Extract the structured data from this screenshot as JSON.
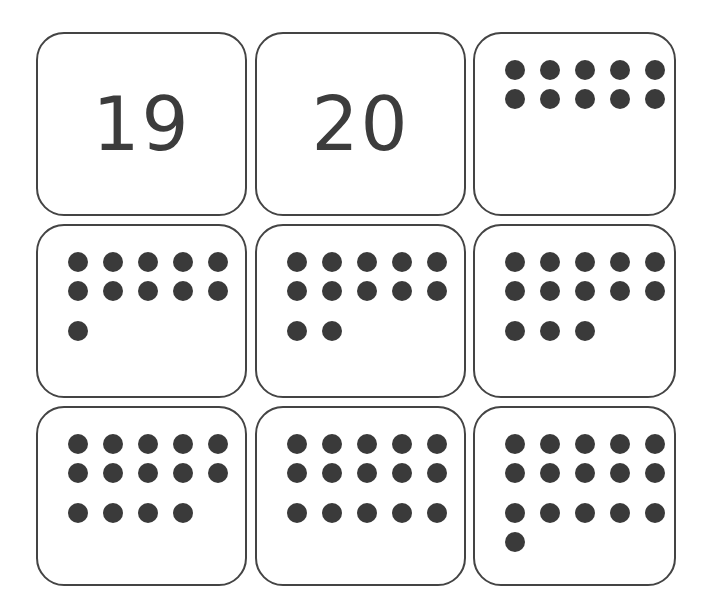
{
  "page": {
    "background_color": "#ffffff",
    "card_border_color": "#444444",
    "card_fill_color": "#ffffff",
    "dot_color": "#3a3a3a",
    "numeral_color": "#3c3c3c",
    "grid_rows": 3,
    "grid_columns": 3
  },
  "cards": [
    {
      "id": "card-1",
      "position": "row-1-col-1",
      "type": "numeral",
      "numeral": "19",
      "value": 19,
      "dot_rows": []
    },
    {
      "id": "card-2",
      "position": "row-1-col-2",
      "type": "numeral",
      "numeral": "20",
      "value": 20,
      "dot_rows": []
    },
    {
      "id": "card-3",
      "position": "row-1-col-3",
      "type": "dots",
      "numeral": "",
      "value": 10,
      "dot_rows": [
        5,
        5
      ]
    },
    {
      "id": "card-4",
      "position": "row-2-col-1",
      "type": "dots",
      "numeral": "",
      "value": 11,
      "dot_rows": [
        5,
        5,
        1
      ]
    },
    {
      "id": "card-5",
      "position": "row-2-col-2",
      "type": "dots",
      "numeral": "",
      "value": 12,
      "dot_rows": [
        5,
        5,
        2
      ]
    },
    {
      "id": "card-6",
      "position": "row-2-col-3",
      "type": "dots",
      "numeral": "",
      "value": 13,
      "dot_rows": [
        5,
        5,
        3
      ]
    },
    {
      "id": "card-7",
      "position": "row-3-col-1",
      "type": "dots",
      "numeral": "",
      "value": 14,
      "dot_rows": [
        5,
        5,
        4
      ]
    },
    {
      "id": "card-8",
      "position": "row-3-col-2",
      "type": "dots",
      "numeral": "",
      "value": 15,
      "dot_rows": [
        5,
        5,
        5
      ]
    },
    {
      "id": "card-9",
      "position": "row-3-col-3",
      "type": "dots",
      "numeral": "",
      "value": 16,
      "dot_rows": [
        5,
        5,
        5,
        1
      ]
    }
  ]
}
